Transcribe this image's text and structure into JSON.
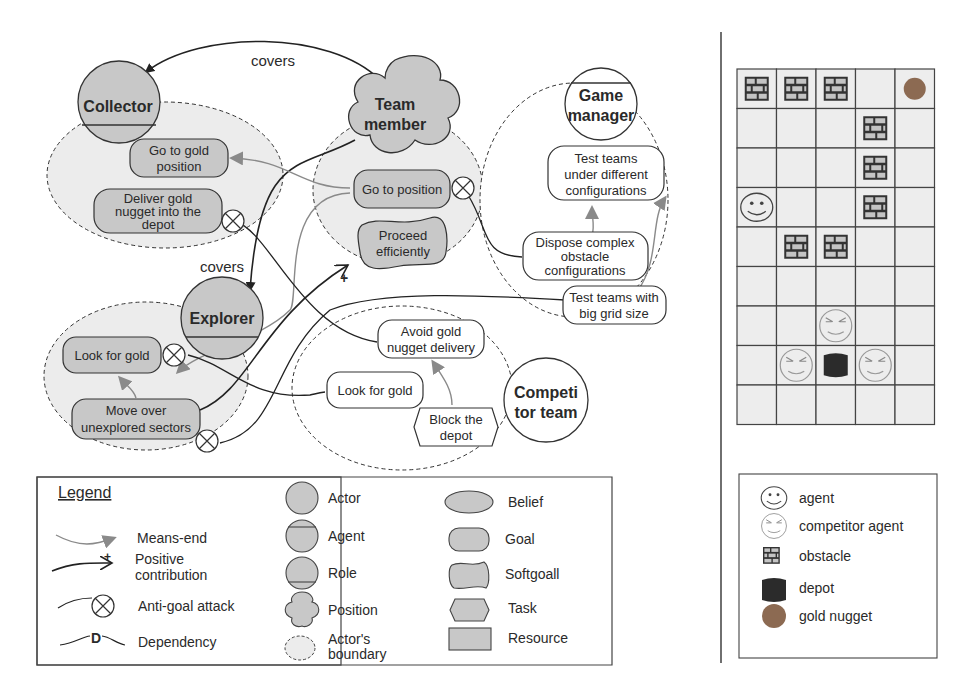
{
  "diagram": {
    "relations": {
      "covers_top": "covers",
      "covers_mid": "covers"
    },
    "actors": {
      "collector": {
        "name": "Collector",
        "type": "role"
      },
      "team_member": {
        "name_line1": "Team",
        "name_line2": "member",
        "type": "position"
      },
      "game_manager": {
        "name_line1": "Game",
        "name_line2": "manager",
        "type": "agent"
      },
      "explorer": {
        "name": "Explorer",
        "type": "role"
      },
      "competitor_team": {
        "name_line1": "Competi",
        "name_line2": "tor team",
        "type": "actor"
      }
    },
    "goals": {
      "go_to_gold_position": {
        "line1": "Go to gold",
        "line2": "position"
      },
      "deliver_gold": {
        "line1": "Deliver gold",
        "line2": "nugget into the",
        "line3": "depot"
      },
      "go_to_position": {
        "line1": "Go to position"
      },
      "test_teams_configs": {
        "line1": "Test teams",
        "line2": "under different",
        "line3": "configurations"
      },
      "dispose_obstacles": {
        "line1": "Dispose complex",
        "line2": "obstacle",
        "line3": "configurations"
      },
      "test_big_grid": {
        "line1": "Test teams with",
        "line2": "big grid size"
      },
      "look_for_gold_explorer": {
        "line1": "Look for gold"
      },
      "move_unexplored": {
        "line1": "Move over",
        "line2": "unexplored sectors"
      },
      "avoid_delivery": {
        "line1": "Avoid gold",
        "line2": "nugget delivery"
      },
      "look_for_gold_competitor": {
        "line1": "Look for gold"
      }
    },
    "softgoals": {
      "proceed_efficiently": {
        "line1": "Proceed",
        "line2": "efficiently"
      }
    },
    "tasks": {
      "block_depot": {
        "line1": "Block the",
        "line2": "depot"
      }
    },
    "contribution_sign": "+"
  },
  "legend": {
    "title": "Legend",
    "links": [
      {
        "label": "Means-end"
      },
      {
        "label_line1": "Positive",
        "label_line2": "contribution",
        "sign": "+"
      },
      {
        "label": "Anti-goal attack"
      },
      {
        "label": "Dependency",
        "glyph": "D"
      }
    ],
    "actors": [
      {
        "label": "Actor"
      },
      {
        "label": "Agent"
      },
      {
        "label": "Role"
      },
      {
        "label": "Position"
      },
      {
        "label_line1": "Actor's",
        "label_line2": "boundary"
      }
    ],
    "elements": [
      {
        "label": "Belief"
      },
      {
        "label": "Goal"
      },
      {
        "label": "Softgoall"
      },
      {
        "label": "Task"
      },
      {
        "label": "Resource"
      }
    ]
  },
  "grid": {
    "columns": 5,
    "rows": 9,
    "cells": [
      [
        "obstacle",
        "obstacle",
        "obstacle",
        "empty",
        "gold"
      ],
      [
        "empty",
        "empty",
        "empty",
        "obstacle",
        "empty"
      ],
      [
        "empty",
        "empty",
        "empty",
        "obstacle",
        "empty"
      ],
      [
        "agent",
        "empty",
        "empty",
        "obstacle",
        "empty"
      ],
      [
        "empty",
        "obstacle",
        "obstacle",
        "empty",
        "empty"
      ],
      [
        "empty",
        "empty",
        "empty",
        "empty",
        "empty"
      ],
      [
        "empty",
        "empty",
        "competitor",
        "empty",
        "empty"
      ],
      [
        "empty",
        "competitor",
        "depot",
        "competitor",
        "empty"
      ],
      [
        "empty",
        "empty",
        "empty",
        "empty",
        "empty"
      ]
    ]
  },
  "grid_legend": {
    "items": [
      {
        "icon": "agent-icon",
        "label": "agent"
      },
      {
        "icon": "competitor-agent-icon",
        "label": "competitor agent"
      },
      {
        "icon": "obstacle-icon",
        "label": "obstacle"
      },
      {
        "icon": "depot-icon",
        "label": "depot"
      },
      {
        "icon": "gold-nugget-icon",
        "label": "gold nugget"
      }
    ]
  },
  "colors": {
    "node_fill": "#c8c8c8",
    "boundary_fill": "#ececec",
    "stroke": "#333333",
    "means_end": "#8a8a8a",
    "cell_fill": "#ededed",
    "depot": "#2b2b2b",
    "gold": "#8c6a52"
  }
}
